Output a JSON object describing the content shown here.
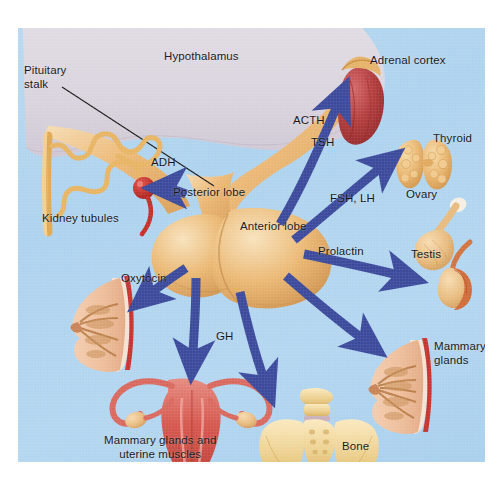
{
  "figure": {
    "background_color": "#b0d4ef",
    "arrow_color": "#3c4a9c",
    "border_color": "#ffffff"
  },
  "anatomy_labels": {
    "hypothalamus": "Hypothalamus",
    "pituitary_stalk": "Pituitary\nstalk",
    "posterior_lobe": "Posterior lobe",
    "anterior_lobe": "Anterior lobe"
  },
  "hormones": [
    {
      "id": "adh",
      "label": "ADH",
      "target": "Kidney tubules"
    },
    {
      "id": "oxytocin",
      "label": "Oxytocin",
      "target": "Mammary glands and uterine muscles"
    },
    {
      "id": "acth",
      "label": "ACTH",
      "target": "Adrenal cortex"
    },
    {
      "id": "tsh",
      "label": "TSH",
      "target": "Thyroid"
    },
    {
      "id": "fsh_lh",
      "label": "FSH, LH",
      "target": "Ovary / Testis"
    },
    {
      "id": "prolactin",
      "label": "Prolactin",
      "target": "Mammary glands"
    },
    {
      "id": "gh",
      "label": "GH",
      "target": "Bone"
    }
  ],
  "targets": {
    "kidney_tubules": "Kidney tubules",
    "adrenal_cortex": "Adrenal cortex",
    "thyroid": "Thyroid",
    "ovary": "Ovary",
    "testis": "Testis",
    "mammary_glands": "Mammary\nglands",
    "bone": "Bone",
    "mammary_uterine": "Mammary glands and\nuterine muscles"
  },
  "colors": {
    "gland_tan": "#e8b06a",
    "hypothalamus_grey": "#ddd8e0",
    "adrenal_red": "#b4393a",
    "uterus_red": "#d9534f",
    "arrow_indigo": "#3c4a9c"
  }
}
